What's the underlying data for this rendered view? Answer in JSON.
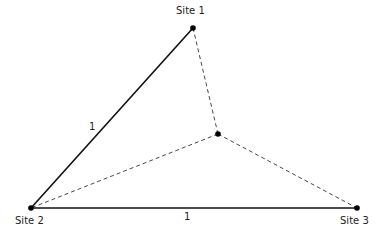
{
  "diagram": {
    "sites": [
      {
        "id": "site1",
        "label": "Site 1",
        "x": 193,
        "y": 28
      },
      {
        "id": "site2",
        "label": "Site 2",
        "x": 31,
        "y": 208
      },
      {
        "id": "site3",
        "label": "Site 3",
        "x": 357,
        "y": 208
      }
    ],
    "center_point": {
      "x": 218,
      "y": 134
    },
    "solid_edges": [
      {
        "from": "site1",
        "to": "site2",
        "label": "1"
      },
      {
        "from": "site2",
        "to": "site3",
        "label": "1"
      }
    ],
    "dashed_edges": [
      {
        "from": "center",
        "to": "site1"
      },
      {
        "from": "center",
        "to": "site2"
      },
      {
        "from": "center",
        "to": "site3"
      }
    ],
    "colors": {
      "line": "#111111",
      "background": "#ffffff"
    }
  }
}
